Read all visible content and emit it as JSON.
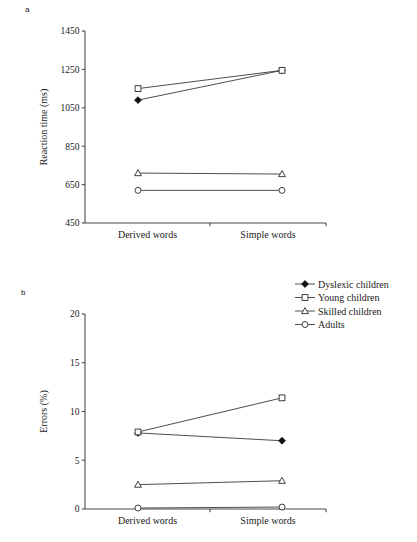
{
  "figure": {
    "panel_a_label": "a",
    "panel_b_label": "b"
  },
  "legend": {
    "position": "top-right",
    "items": [
      {
        "label": "Dyslexic children",
        "marker": "filled-diamond-icon"
      },
      {
        "label": "Young children",
        "marker": "open-square-icon"
      },
      {
        "label": "Skilled children",
        "marker": "open-triangle-icon"
      },
      {
        "label": "Adults",
        "marker": "open-circle-icon"
      }
    ]
  },
  "chart_data": [
    {
      "panel": "a",
      "type": "line",
      "title": "",
      "xlabel": "",
      "ylabel": "Reaction time (ms)",
      "categories": [
        "Derived words",
        "Simple words"
      ],
      "ylim": [
        450,
        1450
      ],
      "yticks": [
        450,
        650,
        850,
        1050,
        1250,
        1450
      ],
      "ytick_labels": [
        "450",
        "650",
        "850",
        "1050",
        "1250",
        "1450"
      ],
      "grid": false,
      "legend": "shared-with-panel-b",
      "series": [
        {
          "name": "Dyslexic children",
          "marker": "filled-diamond",
          "values": [
            1090,
            1245
          ]
        },
        {
          "name": "Young children",
          "marker": "open-square",
          "values": [
            1150,
            1245
          ]
        },
        {
          "name": "Skilled children",
          "marker": "open-triangle",
          "values": [
            710,
            705
          ]
        },
        {
          "name": "Adults",
          "marker": "open-circle",
          "values": [
            620,
            620
          ]
        }
      ]
    },
    {
      "panel": "b",
      "type": "line",
      "title": "",
      "xlabel": "",
      "ylabel": "Errors (%)",
      "categories": [
        "Derived words",
        "Simple words"
      ],
      "ylim": [
        0,
        20
      ],
      "yticks": [
        0,
        5,
        10,
        15,
        20
      ],
      "ytick_labels": [
        "0",
        "5",
        "10",
        "15",
        "20"
      ],
      "grid": false,
      "legend": "top-right",
      "series": [
        {
          "name": "Dyslexic children",
          "marker": "filled-diamond",
          "values": [
            7.8,
            7.0
          ]
        },
        {
          "name": "Young children",
          "marker": "open-square",
          "values": [
            7.9,
            11.4
          ]
        },
        {
          "name": "Skilled children",
          "marker": "open-triangle",
          "values": [
            2.5,
            2.9
          ]
        },
        {
          "name": "Adults",
          "marker": "open-circle",
          "values": [
            0.1,
            0.2
          ]
        }
      ]
    }
  ]
}
